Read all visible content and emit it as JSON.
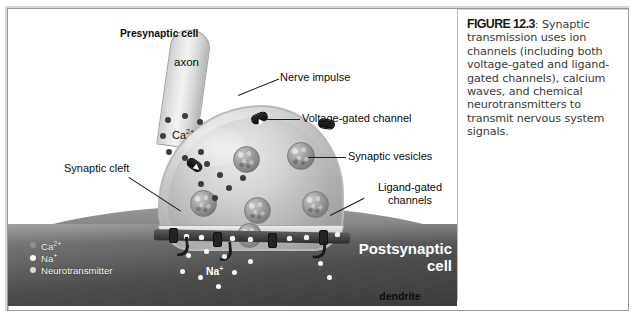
{
  "figure": {
    "number_label": "FIGURE 12.3",
    "caption_separator": ":",
    "caption_text": " Synaptic transmission uses ion channels (including both voltage-gated and ligand-gated channels), calcium waves, and chemical neurotransmitters to transmit nervous system signals."
  },
  "diagram": {
    "labels": {
      "presynaptic_cell": "Presynaptic cell",
      "axon": "axon",
      "nerve_impulse": "Nerve impulse",
      "voltage_gated_channel": "Voltage-gated channel",
      "synaptic_vesicles": "Synaptic vesicles",
      "synaptic_cleft": "Synaptic cleft",
      "ligand_gated_line1": "Ligand-gated",
      "ligand_gated_line2": "channels",
      "postsynaptic_line1": "Postsynaptic",
      "postsynaptic_line2": "cell",
      "dendrite": "dendrite"
    },
    "ion_annotations": {
      "calcium": "Ca",
      "calcium_charge": "2+",
      "sodium": "Na",
      "sodium_charge": "+"
    },
    "legend": {
      "items": [
        {
          "label": "Ca",
          "charge": "2+",
          "color": "#8f8f8f"
        },
        {
          "label": "Na",
          "charge": "+",
          "color": "#fbfbfb"
        },
        {
          "label": "Neurotransmitter",
          "charge": "",
          "color": "#d9dcd2"
        }
      ]
    },
    "colors": {
      "postsynaptic_cell": "#4e4e4e",
      "presynaptic_cell": "#d3d3d3",
      "channel_protein": "#161616",
      "frame_border": "#9a9a9a",
      "caption_text": "#3a3a3a"
    }
  }
}
